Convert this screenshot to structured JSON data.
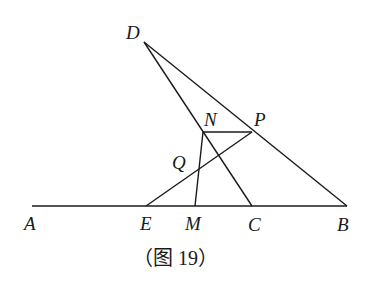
{
  "figure": {
    "caption": "（图 19）",
    "points": {
      "A": {
        "label": "A",
        "x": 32,
        "y": 206
      },
      "B": {
        "label": "B",
        "x": 347,
        "y": 206
      },
      "C": {
        "label": "C",
        "x": 252,
        "y": 206
      },
      "D": {
        "label": "D",
        "x": 144,
        "y": 42
      },
      "E": {
        "label": "E",
        "x": 146,
        "y": 206
      },
      "M": {
        "label": "M",
        "x": 195,
        "y": 206
      },
      "N": {
        "label": "N",
        "x": 203,
        "y": 132
      },
      "P": {
        "label": "P",
        "x": 252,
        "y": 132
      },
      "Q": {
        "label": "Q",
        "x": 199,
        "y": 170
      }
    },
    "segments": [
      [
        "A",
        "B"
      ],
      [
        "D",
        "B"
      ],
      [
        "D",
        "C"
      ],
      [
        "N",
        "P"
      ],
      [
        "E",
        "P"
      ],
      [
        "N",
        "M"
      ]
    ]
  }
}
